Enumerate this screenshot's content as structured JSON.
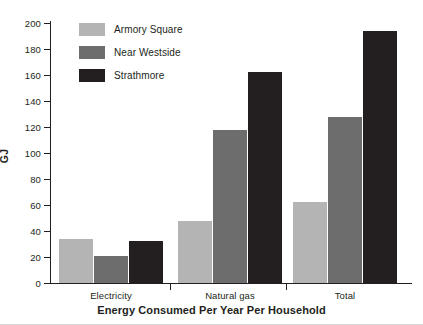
{
  "chart_data": {
    "type": "bar",
    "title": "Energy Consumed Per Year Per Household",
    "xlabel": "",
    "ylabel": "GJ",
    "ylim": [
      0,
      200
    ],
    "ytick_step": 20,
    "yticks": [
      0,
      20,
      40,
      60,
      80,
      100,
      120,
      140,
      160,
      180,
      200
    ],
    "ytick_labels": [
      "0",
      "20",
      "40",
      "60",
      "80",
      "100",
      "120",
      "140",
      "160",
      "180",
      "200"
    ],
    "grid": false,
    "legend_position": "top-left-inside",
    "categories": [
      "Electricity",
      "Natural gas",
      "Total"
    ],
    "series": [
      {
        "name": "Armory Square",
        "color": "#b4b4b4",
        "values": [
          34,
          48,
          62
        ]
      },
      {
        "name": "Near Westside",
        "color": "#6d6d6d",
        "values": [
          21,
          118,
          128
        ]
      },
      {
        "name": "Strathmore",
        "color": "#231f20",
        "values": [
          32,
          162,
          194
        ]
      }
    ]
  }
}
